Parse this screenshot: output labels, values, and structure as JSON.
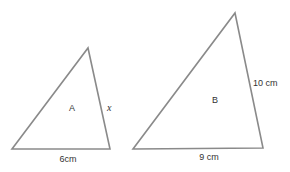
{
  "diagram": {
    "type": "similar-triangles",
    "triangles": [
      {
        "name": "A",
        "label": "A",
        "sides": {
          "base": "6cm",
          "right": "x"
        }
      },
      {
        "name": "B",
        "label": "B",
        "sides": {
          "base": "9 cm",
          "right": "10 cm"
        }
      }
    ],
    "colors": {
      "stroke": "#8a8a8a",
      "text": "#333333"
    }
  }
}
